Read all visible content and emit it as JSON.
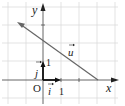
{
  "diagram": {
    "type": "coordinate-plane-vector",
    "axes": {
      "x_label": "x",
      "y_label": "y",
      "origin_label": "O",
      "x_tick_label": "1",
      "y_tick_label": "1"
    },
    "basis_vectors": {
      "i_label": "i",
      "j_label": "j"
    },
    "vector": {
      "label": "u",
      "from": [
        3,
        0
      ],
      "to": [
        -1.4,
        3.2
      ]
    },
    "line_through": {
      "y_intercept": 2,
      "x_intercept": 3
    },
    "grid": {
      "spacing_units": 1,
      "x_range": [
        -2,
        4
      ],
      "y_range": [
        -1,
        4
      ]
    },
    "colors": {
      "grid": "#d9d9d9",
      "axis": "#222222",
      "vector": "#666666"
    }
  }
}
